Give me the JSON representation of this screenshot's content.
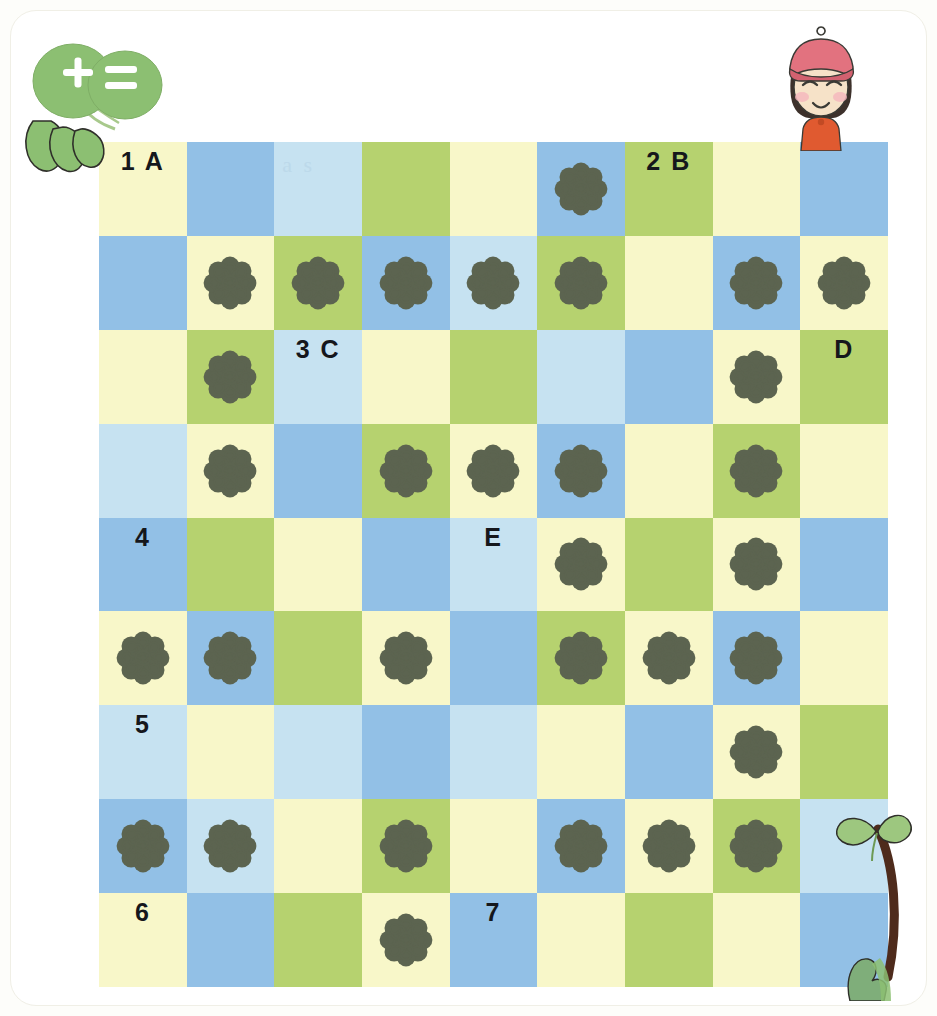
{
  "page": {
    "background_color": "#fdfdfa",
    "panel_color": "#ffffff",
    "ghost_text": "a s"
  },
  "palette": {
    "cream": "#f8f7c9",
    "blue": "#92c0e6",
    "light_blue": "#c6e2f1",
    "green": "#b6d26f",
    "rosette": "#5c6450",
    "label_text": "#15171c",
    "leaf_green": "#8cbf72",
    "cap_pink": "#e2727f",
    "shirt_red": "#e05a30",
    "stem_brown": "#4e2b1c"
  },
  "decorations": {
    "leaf_badge": {
      "name": "clover-badge",
      "symbols": "+="
    },
    "girl": {
      "name": "girl-avatar",
      "description": "girl with pink cap"
    },
    "sprout": {
      "name": "sprout-decoration",
      "description": "clover stem with leaves"
    }
  },
  "grid": {
    "columns": 9,
    "rows": 9,
    "cells": [
      [
        {
          "color": "cream",
          "label": "1 A",
          "flower": false
        },
        {
          "color": "blue",
          "label": "",
          "flower": false
        },
        {
          "color": "light_blue",
          "label": "",
          "flower": false,
          "ghost": true
        },
        {
          "color": "green",
          "label": "",
          "flower": false
        },
        {
          "color": "cream",
          "label": "",
          "flower": false
        },
        {
          "color": "blue",
          "label": "",
          "flower": true
        },
        {
          "color": "green",
          "label": "2 B",
          "flower": false
        },
        {
          "color": "cream",
          "label": "",
          "flower": false
        },
        {
          "color": "blue",
          "label": "",
          "flower": false
        }
      ],
      [
        {
          "color": "blue",
          "label": "",
          "flower": false
        },
        {
          "color": "cream",
          "label": "",
          "flower": true
        },
        {
          "color": "green",
          "label": "",
          "flower": true
        },
        {
          "color": "blue",
          "label": "",
          "flower": true
        },
        {
          "color": "light_blue",
          "label": "",
          "flower": true
        },
        {
          "color": "green",
          "label": "",
          "flower": true
        },
        {
          "color": "cream",
          "label": "",
          "flower": false
        },
        {
          "color": "blue",
          "label": "",
          "flower": true
        },
        {
          "color": "cream",
          "label": "",
          "flower": true
        }
      ],
      [
        {
          "color": "cream",
          "label": "",
          "flower": false
        },
        {
          "color": "green",
          "label": "",
          "flower": true
        },
        {
          "color": "light_blue",
          "label": "3 C",
          "flower": false
        },
        {
          "color": "cream",
          "label": "",
          "flower": false
        },
        {
          "color": "green",
          "label": "",
          "flower": false
        },
        {
          "color": "light_blue",
          "label": "",
          "flower": false
        },
        {
          "color": "blue",
          "label": "",
          "flower": false
        },
        {
          "color": "cream",
          "label": "",
          "flower": true
        },
        {
          "color": "green",
          "label": "D",
          "flower": false
        }
      ],
      [
        {
          "color": "light_blue",
          "label": "",
          "flower": false
        },
        {
          "color": "cream",
          "label": "",
          "flower": true
        },
        {
          "color": "blue",
          "label": "",
          "flower": false
        },
        {
          "color": "green",
          "label": "",
          "flower": true
        },
        {
          "color": "cream",
          "label": "",
          "flower": true
        },
        {
          "color": "blue",
          "label": "",
          "flower": true
        },
        {
          "color": "cream",
          "label": "",
          "flower": false
        },
        {
          "color": "green",
          "label": "",
          "flower": true
        },
        {
          "color": "cream",
          "label": "",
          "flower": false
        }
      ],
      [
        {
          "color": "blue",
          "label": "4",
          "flower": false
        },
        {
          "color": "green",
          "label": "",
          "flower": false
        },
        {
          "color": "cream",
          "label": "",
          "flower": false
        },
        {
          "color": "blue",
          "label": "",
          "flower": false
        },
        {
          "color": "light_blue",
          "label": "E",
          "flower": false
        },
        {
          "color": "cream",
          "label": "",
          "flower": true
        },
        {
          "color": "green",
          "label": "",
          "flower": false
        },
        {
          "color": "cream",
          "label": "",
          "flower": true
        },
        {
          "color": "blue",
          "label": "",
          "flower": false
        }
      ],
      [
        {
          "color": "cream",
          "label": "",
          "flower": true
        },
        {
          "color": "blue",
          "label": "",
          "flower": true
        },
        {
          "color": "green",
          "label": "",
          "flower": false
        },
        {
          "color": "cream",
          "label": "",
          "flower": true
        },
        {
          "color": "blue",
          "label": "",
          "flower": false
        },
        {
          "color": "green",
          "label": "",
          "flower": true
        },
        {
          "color": "cream",
          "label": "",
          "flower": true
        },
        {
          "color": "blue",
          "label": "",
          "flower": true
        },
        {
          "color": "cream",
          "label": "",
          "flower": false
        }
      ],
      [
        {
          "color": "light_blue",
          "label": "5",
          "flower": false
        },
        {
          "color": "cream",
          "label": "",
          "flower": false
        },
        {
          "color": "light_blue",
          "label": "",
          "flower": false
        },
        {
          "color": "blue",
          "label": "",
          "flower": false
        },
        {
          "color": "light_blue",
          "label": "",
          "flower": false
        },
        {
          "color": "cream",
          "label": "",
          "flower": false
        },
        {
          "color": "blue",
          "label": "",
          "flower": false
        },
        {
          "color": "cream",
          "label": "",
          "flower": true
        },
        {
          "color": "green",
          "label": "",
          "flower": false
        }
      ],
      [
        {
          "color": "blue",
          "label": "",
          "flower": true
        },
        {
          "color": "light_blue",
          "label": "",
          "flower": true
        },
        {
          "color": "cream",
          "label": "",
          "flower": false
        },
        {
          "color": "green",
          "label": "",
          "flower": true
        },
        {
          "color": "cream",
          "label": "",
          "flower": false
        },
        {
          "color": "blue",
          "label": "",
          "flower": true
        },
        {
          "color": "cream",
          "label": "",
          "flower": true
        },
        {
          "color": "green",
          "label": "",
          "flower": true
        },
        {
          "color": "light_blue",
          "label": "",
          "flower": false
        }
      ],
      [
        {
          "color": "cream",
          "label": "6",
          "flower": false
        },
        {
          "color": "blue",
          "label": "",
          "flower": false
        },
        {
          "color": "green",
          "label": "",
          "flower": false
        },
        {
          "color": "cream",
          "label": "",
          "flower": true
        },
        {
          "color": "blue",
          "label": "7",
          "flower": false
        },
        {
          "color": "cream",
          "label": "",
          "flower": false
        },
        {
          "color": "green",
          "label": "",
          "flower": false
        },
        {
          "color": "cream",
          "label": "",
          "flower": false
        },
        {
          "color": "blue",
          "label": "",
          "flower": false
        }
      ]
    ]
  }
}
